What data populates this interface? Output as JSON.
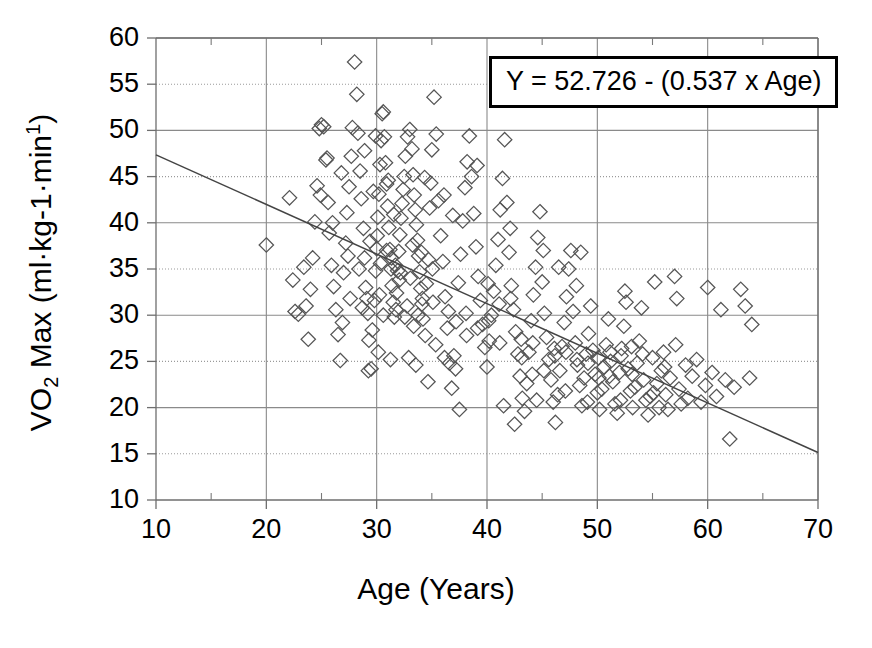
{
  "chart_data": {
    "type": "scatter",
    "title": "",
    "xlabel": "Age (Years)",
    "ylabel": "VO2 Max (ml·kg-1·min1)",
    "ylabel_parts": {
      "prefix": "VO",
      "sub": "2",
      "mid": " Max (ml·kg-1·min",
      "sup": "1",
      "suffix": ")"
    },
    "xlim": [
      10,
      70
    ],
    "ylim": [
      10,
      60
    ],
    "xticks": [
      10,
      20,
      30,
      40,
      50,
      60,
      70
    ],
    "yticks": [
      10,
      15,
      20,
      25,
      30,
      35,
      40,
      45,
      50,
      55,
      60
    ],
    "x_minor_tick_step": 5,
    "grid": "major-x-solid, y-10s-solid, y-5s-dotted",
    "legend": "none",
    "marker": "open-diamond",
    "marker_color": "#555555",
    "annotation": {
      "text": "Y = 52.726 - (0.537 x Age)",
      "intercept": 52.726,
      "slope": -0.537,
      "variable": "Age"
    },
    "fit_line": {
      "type": "linear",
      "x_start": 10,
      "y_start": 47.356,
      "x_end": 70,
      "y_end": 15.136,
      "color": "#444444"
    },
    "points": [
      [
        20.0,
        37.6
      ],
      [
        22.1,
        42.7
      ],
      [
        22.4,
        33.8
      ],
      [
        22.6,
        30.4
      ],
      [
        22.9,
        30.1
      ],
      [
        23.4,
        35.2
      ],
      [
        23.6,
        31.0
      ],
      [
        23.8,
        27.4
      ],
      [
        24.0,
        32.8
      ],
      [
        24.2,
        36.2
      ],
      [
        24.4,
        40.1
      ],
      [
        24.6,
        44.0
      ],
      [
        24.8,
        50.2
      ],
      [
        25.0,
        50.6
      ],
      [
        25.2,
        50.4
      ],
      [
        25.4,
        46.8
      ],
      [
        25.6,
        42.2
      ],
      [
        25.7,
        38.9
      ],
      [
        25.9,
        35.4
      ],
      [
        26.1,
        33.1
      ],
      [
        26.3,
        30.6
      ],
      [
        26.5,
        27.9
      ],
      [
        26.7,
        25.1
      ],
      [
        26.9,
        29.2
      ],
      [
        27.0,
        34.6
      ],
      [
        27.2,
        37.8
      ],
      [
        27.3,
        41.1
      ],
      [
        27.5,
        43.9
      ],
      [
        27.7,
        47.2
      ],
      [
        27.8,
        50.3
      ],
      [
        28.0,
        57.4
      ],
      [
        28.2,
        53.9
      ],
      [
        28.3,
        49.7
      ],
      [
        28.5,
        45.6
      ],
      [
        28.6,
        42.6
      ],
      [
        28.8,
        39.4
      ],
      [
        28.9,
        36.2
      ],
      [
        29.0,
        33.0
      ],
      [
        29.2,
        30.2
      ],
      [
        29.3,
        27.3
      ],
      [
        29.5,
        24.2
      ],
      [
        29.6,
        28.4
      ],
      [
        29.8,
        31.6
      ],
      [
        29.9,
        34.8
      ],
      [
        30.0,
        37.2
      ],
      [
        30.1,
        40.6
      ],
      [
        30.2,
        43.1
      ],
      [
        30.3,
        46.3
      ],
      [
        30.4,
        48.9
      ],
      [
        30.5,
        51.8
      ],
      [
        30.6,
        52.0
      ],
      [
        30.7,
        49.3
      ],
      [
        30.8,
        46.5
      ],
      [
        30.9,
        44.2
      ],
      [
        31.0,
        41.8
      ],
      [
        31.1,
        39.5
      ],
      [
        31.2,
        37.1
      ],
      [
        31.3,
        35.0
      ],
      [
        31.4,
        33.2
      ],
      [
        31.5,
        31.4
      ],
      [
        31.6,
        29.8
      ],
      [
        31.8,
        32.4
      ],
      [
        31.9,
        34.8
      ],
      [
        32.0,
        36.9
      ],
      [
        32.1,
        38.7
      ],
      [
        32.2,
        40.5
      ],
      [
        32.3,
        42.1
      ],
      [
        32.4,
        43.6
      ],
      [
        32.5,
        45.0
      ],
      [
        32.6,
        47.2
      ],
      [
        32.8,
        49.3
      ],
      [
        33.0,
        50.1
      ],
      [
        33.2,
        48.0
      ],
      [
        33.3,
        45.2
      ],
      [
        33.4,
        43.0
      ],
      [
        33.5,
        41.4
      ],
      [
        33.6,
        39.8
      ],
      [
        33.7,
        38.1
      ],
      [
        33.8,
        36.4
      ],
      [
        33.9,
        34.7
      ],
      [
        34.0,
        32.9
      ],
      [
        34.1,
        31.2
      ],
      [
        34.2,
        29.6
      ],
      [
        34.4,
        27.8
      ],
      [
        34.5,
        33.4
      ],
      [
        34.7,
        36.0
      ],
      [
        34.8,
        41.6
      ],
      [
        34.9,
        44.3
      ],
      [
        35.0,
        47.9
      ],
      [
        35.2,
        53.6
      ],
      [
        35.4,
        49.6
      ],
      [
        35.6,
        42.4
      ],
      [
        35.8,
        38.6
      ],
      [
        36.0,
        35.8
      ],
      [
        36.2,
        32.0
      ],
      [
        36.4,
        28.6
      ],
      [
        36.6,
        24.8
      ],
      [
        36.8,
        22.1
      ],
      [
        37.0,
        25.6
      ],
      [
        37.2,
        29.3
      ],
      [
        37.4,
        33.5
      ],
      [
        37.6,
        36.6
      ],
      [
        37.8,
        40.2
      ],
      [
        38.0,
        43.8
      ],
      [
        38.2,
        46.6
      ],
      [
        38.4,
        49.4
      ],
      [
        38.6,
        45.0
      ],
      [
        38.8,
        41.0
      ],
      [
        39.0,
        37.4
      ],
      [
        39.2,
        34.2
      ],
      [
        39.4,
        31.6
      ],
      [
        39.6,
        29.0
      ],
      [
        39.8,
        26.5
      ],
      [
        40.0,
        24.4
      ],
      [
        40.2,
        27.2
      ],
      [
        40.4,
        30.0
      ],
      [
        40.6,
        32.6
      ],
      [
        40.8,
        35.4
      ],
      [
        41.0,
        38.2
      ],
      [
        41.2,
        41.4
      ],
      [
        41.4,
        44.8
      ],
      [
        41.6,
        49.0
      ],
      [
        41.8,
        42.2
      ],
      [
        42.0,
        36.8
      ],
      [
        42.2,
        33.2
      ],
      [
        42.4,
        30.6
      ],
      [
        42.6,
        28.2
      ],
      [
        42.8,
        25.8
      ],
      [
        43.0,
        23.4
      ],
      [
        43.2,
        21.0
      ],
      [
        43.4,
        19.6
      ],
      [
        43.6,
        22.6
      ],
      [
        43.8,
        26.0
      ],
      [
        44.0,
        29.4
      ],
      [
        44.2,
        32.2
      ],
      [
        44.4,
        35.2
      ],
      [
        44.6,
        38.4
      ],
      [
        44.8,
        41.2
      ],
      [
        45.0,
        33.6
      ],
      [
        45.2,
        30.2
      ],
      [
        45.4,
        27.6
      ],
      [
        45.6,
        25.2
      ],
      [
        45.8,
        23.0
      ],
      [
        46.0,
        20.6
      ],
      [
        46.2,
        18.4
      ],
      [
        46.4,
        21.4
      ],
      [
        46.6,
        24.0
      ],
      [
        46.8,
        26.6
      ],
      [
        47.0,
        29.2
      ],
      [
        47.2,
        32.0
      ],
      [
        47.4,
        35.0
      ],
      [
        47.6,
        37.0
      ],
      [
        47.8,
        30.4
      ],
      [
        48.0,
        27.0
      ],
      [
        48.2,
        24.6
      ],
      [
        48.4,
        22.4
      ],
      [
        48.6,
        20.2
      ],
      [
        48.8,
        23.2
      ],
      [
        49.0,
        25.8
      ],
      [
        49.2,
        28.0
      ],
      [
        49.4,
        31.0
      ],
      [
        49.6,
        26.2
      ],
      [
        49.8,
        23.6
      ],
      [
        50.0,
        21.6
      ],
      [
        50.2,
        19.8
      ],
      [
        50.4,
        22.0
      ],
      [
        50.6,
        24.4
      ],
      [
        50.8,
        26.8
      ],
      [
        51.0,
        29.6
      ],
      [
        51.2,
        25.0
      ],
      [
        51.4,
        22.8
      ],
      [
        51.6,
        20.4
      ],
      [
        51.8,
        19.4
      ],
      [
        52.0,
        23.8
      ],
      [
        52.2,
        26.4
      ],
      [
        52.4,
        28.8
      ],
      [
        52.6,
        31.4
      ],
      [
        52.8,
        24.2
      ],
      [
        53.0,
        21.8
      ],
      [
        53.2,
        20.0
      ],
      [
        53.4,
        22.2
      ],
      [
        53.6,
        24.8
      ],
      [
        53.8,
        27.2
      ],
      [
        54.0,
        30.8
      ],
      [
        54.2,
        23.0
      ],
      [
        54.4,
        20.8
      ],
      [
        54.6,
        19.2
      ],
      [
        54.8,
        21.2
      ],
      [
        55.0,
        25.4
      ],
      [
        55.2,
        33.6
      ],
      [
        55.4,
        22.6
      ],
      [
        55.6,
        20.0
      ],
      [
        55.8,
        24.0
      ],
      [
        56.0,
        26.0
      ],
      [
        56.2,
        21.4
      ],
      [
        56.4,
        19.8
      ],
      [
        56.6,
        23.2
      ],
      [
        57.0,
        34.2
      ],
      [
        57.2,
        31.8
      ],
      [
        57.4,
        22.0
      ],
      [
        57.6,
        20.4
      ],
      [
        58.0,
        24.6
      ],
      [
        58.2,
        21.0
      ],
      [
        58.6,
        23.4
      ],
      [
        59.0,
        25.2
      ],
      [
        59.4,
        20.6
      ],
      [
        59.8,
        22.4
      ],
      [
        60.0,
        33.0
      ],
      [
        60.4,
        23.8
      ],
      [
        60.8,
        21.2
      ],
      [
        61.2,
        30.6
      ],
      [
        61.6,
        23.0
      ],
      [
        62.0,
        16.6
      ],
      [
        62.4,
        22.2
      ],
      [
        63.0,
        32.8
      ],
      [
        63.4,
        31.0
      ],
      [
        63.8,
        23.2
      ],
      [
        64.0,
        29.0
      ],
      [
        24.9,
        43.0
      ],
      [
        25.5,
        47.0
      ],
      [
        26.0,
        40.0
      ],
      [
        27.6,
        31.8
      ],
      [
        28.4,
        35.0
      ],
      [
        29.7,
        43.4
      ],
      [
        30.35,
        35.6
      ],
      [
        31.05,
        44.6
      ],
      [
        31.55,
        40.9
      ],
      [
        32.05,
        33.8
      ],
      [
        32.75,
        31.0
      ],
      [
        33.25,
        37.6
      ],
      [
        33.75,
        30.0
      ],
      [
        34.35,
        44.9
      ],
      [
        35.1,
        31.4
      ],
      [
        36.1,
        43.0
      ],
      [
        36.9,
        40.8
      ],
      [
        38.1,
        30.2
      ],
      [
        39.1,
        46.2
      ],
      [
        40.1,
        33.4
      ],
      [
        41.1,
        31.2
      ],
      [
        42.1,
        39.4
      ],
      [
        43.1,
        27.4
      ],
      [
        44.1,
        23.6
      ],
      [
        45.1,
        37.0
      ],
      [
        46.1,
        26.4
      ],
      [
        47.1,
        21.8
      ],
      [
        48.1,
        33.2
      ],
      [
        49.1,
        20.6
      ],
      [
        50.1,
        25.4
      ],
      [
        51.1,
        23.4
      ],
      [
        52.1,
        20.8
      ],
      [
        53.1,
        26.6
      ],
      [
        54.1,
        25.8
      ],
      [
        55.1,
        21.6
      ],
      [
        56.1,
        24.4
      ],
      [
        57.1,
        26.8
      ],
      [
        30.9,
        37.0
      ],
      [
        31.35,
        36.2
      ],
      [
        31.7,
        35.4
      ],
      [
        32.15,
        34.6
      ],
      [
        29.4,
        38.0
      ],
      [
        30.05,
        38.6
      ],
      [
        33.05,
        34.0
      ],
      [
        34.05,
        36.8
      ],
      [
        35.05,
        35.0
      ],
      [
        28.7,
        30.8
      ],
      [
        29.1,
        31.8
      ],
      [
        30.25,
        32.2
      ],
      [
        31.75,
        30.6
      ],
      [
        32.55,
        29.8
      ],
      [
        33.35,
        28.8
      ],
      [
        34.15,
        31.8
      ],
      [
        35.35,
        26.8
      ],
      [
        36.15,
        25.4
      ],
      [
        37.15,
        24.2
      ],
      [
        38.15,
        27.8
      ],
      [
        39.15,
        28.6
      ],
      [
        40.15,
        29.4
      ],
      [
        41.15,
        27.0
      ],
      [
        42.15,
        31.8
      ],
      [
        43.15,
        25.4
      ],
      [
        44.15,
        27.0
      ],
      [
        45.15,
        24.0
      ],
      [
        46.15,
        25.6
      ],
      [
        47.15,
        26.0
      ],
      [
        48.15,
        25.2
      ],
      [
        49.15,
        24.8
      ],
      [
        50.15,
        23.2
      ],
      [
        51.15,
        26.0
      ],
      [
        52.15,
        25.6
      ],
      [
        53.15,
        23.6
      ],
      [
        26.8,
        45.4
      ],
      [
        27.4,
        36.4
      ],
      [
        28.9,
        47.8
      ],
      [
        29.9,
        49.4
      ],
      [
        30.6,
        30.0
      ],
      [
        32.9,
        25.4
      ],
      [
        33.55,
        24.6
      ],
      [
        34.65,
        22.8
      ],
      [
        36.5,
        30.4
      ],
      [
        37.5,
        19.8
      ],
      [
        41.5,
        20.2
      ],
      [
        42.5,
        18.2
      ],
      [
        44.5,
        20.8
      ],
      [
        46.5,
        35.2
      ],
      [
        48.5,
        36.8
      ],
      [
        52.5,
        32.6
      ],
      [
        30.15,
        26.0
      ],
      [
        31.25,
        25.2
      ],
      [
        29.25,
        24.0
      ]
    ]
  }
}
